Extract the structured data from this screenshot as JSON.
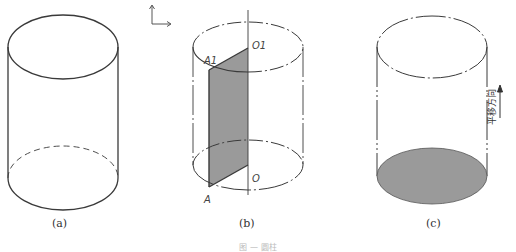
{
  "figure": {
    "panels": [
      {
        "id": "a",
        "label": "(a)",
        "description": "plain cylinder"
      },
      {
        "id": "b",
        "label": "(b)",
        "description": "cylinder with shaded rectangle AA1O1O rotating about axis OO1",
        "points": {
          "A": "A",
          "A1": "A1",
          "O": "O",
          "O1": "O1"
        }
      },
      {
        "id": "c",
        "label": "(c)",
        "description": "cylinder generated by translating the shaded base circle",
        "direction_label": "平移方向"
      }
    ],
    "axis_indicator": "coordinate-axes",
    "caption": "图 — 圆柱",
    "colors": {
      "line": "#3a3a3a",
      "shade": "#9a9a9a",
      "phantom": "#555555"
    }
  }
}
